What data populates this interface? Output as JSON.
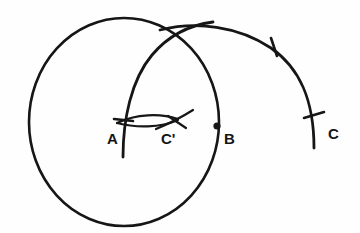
{
  "figure": {
    "type": "geometric-construction-diagram",
    "background_color": "#fefefe",
    "ink_color": "#161616"
  },
  "labels": {
    "a": "A",
    "c_prime": "C'",
    "b": "B",
    "c": "C"
  },
  "points": [
    {
      "name": "A",
      "label": "A",
      "x": 124,
      "y": 122,
      "marker": "tick-cross"
    },
    {
      "name": "C'",
      "label": "C'",
      "x": 172,
      "y": 122,
      "marker": "arc-crossing"
    },
    {
      "name": "B",
      "label": "B",
      "x": 217,
      "y": 126,
      "marker": "filled-dot"
    },
    {
      "name": "C",
      "label": "C",
      "x": 313,
      "y": 123,
      "marker": "tick-cross"
    }
  ],
  "curves": [
    {
      "name": "main-circle",
      "kind": "circle",
      "center_x": 124,
      "center_y": 122,
      "radius_x": 95,
      "radius_y": 104
    },
    {
      "name": "arc-through-a",
      "kind": "arc",
      "center_x": 217,
      "center_y": 126,
      "radius": 94
    },
    {
      "name": "right-arc",
      "kind": "arc",
      "center_x": 190,
      "center_y": 128,
      "radius": 126
    },
    {
      "name": "lens-upper",
      "kind": "short-arc",
      "from_x": 118,
      "from_y": 122,
      "to_x": 176,
      "to_y": 120
    },
    {
      "name": "lens-lower",
      "kind": "short-arc",
      "from_x": 118,
      "from_y": 123,
      "to_x": 176,
      "to_y": 122
    },
    {
      "name": "crossing-stroke-at-c-prime",
      "kind": "short-arc",
      "from_x": 158,
      "from_y": 128,
      "to_x": 190,
      "to_y": 113
    }
  ],
  "tick_marks": [
    {
      "name": "tick-at-a",
      "x": 124,
      "y": 122
    },
    {
      "name": "tick-upper-right",
      "x": 274,
      "y": 46
    },
    {
      "name": "tick-at-c",
      "x": 313,
      "y": 123
    }
  ]
}
